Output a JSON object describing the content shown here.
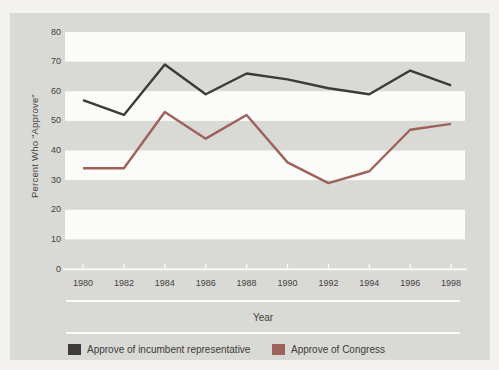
{
  "chart_data": {
    "type": "line",
    "title": "",
    "xlabel": "Year",
    "ylabel": "Percent Who \"Approve\"",
    "categories": [
      "1980",
      "1982",
      "1984",
      "1986",
      "1988",
      "1990",
      "1992",
      "1994",
      "1996",
      "1998"
    ],
    "yticks": [
      0,
      10,
      20,
      30,
      40,
      50,
      60,
      70,
      80
    ],
    "ylim": [
      0,
      80
    ],
    "grid": "alternating horizontal white bands every 10 units on gray background",
    "legend_position": "bottom",
    "series": [
      {
        "name": "Approve of incumbent representative",
        "color": "#3d3a39",
        "values": [
          57,
          52,
          69,
          59,
          66,
          64,
          61,
          59,
          67,
          62
        ]
      },
      {
        "name": "Approve of Congress",
        "color": "#9e625b",
        "values": [
          34,
          34,
          53,
          44,
          52,
          36,
          29,
          33,
          47,
          49
        ]
      }
    ]
  },
  "colors": {
    "figure_background": "#d9d9d6",
    "band_white": "#fbfbf9",
    "page_background": "#f3f2ef",
    "axis_line": "#fbfbf9",
    "text": "#45413f"
  }
}
